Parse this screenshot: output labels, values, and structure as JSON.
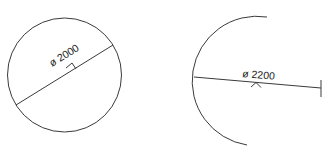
{
  "figures": [
    {
      "kind": "full-circle",
      "dimension_label": "ø 2000",
      "center": [
        64.5,
        75
      ],
      "radius": 57,
      "diameter_line": {
        "from": [
          16,
          105
        ],
        "to": [
          113,
          45
        ]
      },
      "center_mark": [
        73,
        63
      ]
    },
    {
      "kind": "partial-arc",
      "dimension_label": "ø 2200",
      "center": [
        258,
        82
      ],
      "radius": 64,
      "arc_start": [
        267,
        17
      ],
      "arc_end": [
        247,
        145
      ],
      "diameter_line": {
        "from": [
          194,
          77
        ],
        "to": [
          321,
          88
        ]
      },
      "end_tick": {
        "x": 321,
        "y1": 80,
        "y2": 97
      },
      "center_mark": [
        256,
        83
      ]
    }
  ],
  "colors": {
    "line": "#3a3a3a",
    "text": "#1a1a1a",
    "background": "#ffffff"
  }
}
